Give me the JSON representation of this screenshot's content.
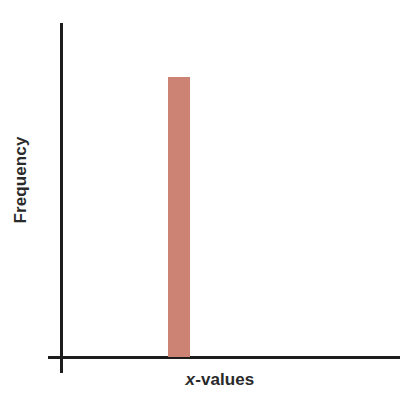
{
  "chart_data": {
    "type": "bar",
    "title": "",
    "subtitle": "",
    "xlabel": "x-values",
    "ylabel": "Frequency",
    "xlabel_italic_prefix": "x",
    "xlabel_rest": "-values",
    "categories": [
      "x"
    ],
    "values": [
      1
    ],
    "series": [
      {
        "name": "Frequency",
        "values": [
          1
        ],
        "color": "#cc8373"
      }
    ],
    "bars": [
      {
        "label": "x",
        "value": 1,
        "color": "#cc8373",
        "center_frac": 0.345,
        "width_frac": 0.065,
        "height_frac": 0.838
      }
    ],
    "ylim": [
      0,
      1.193
    ],
    "xlim": [
      0,
      1
    ],
    "grid": false,
    "legend": false,
    "legend_position": "none",
    "tick_labels_x": [],
    "tick_labels_y": [],
    "annotations": [],
    "axis_color": "#1c1c1c",
    "background": "#ffffff"
  },
  "figure": {
    "background_color": "#ffffff",
    "axis_color": "#1c1c1c",
    "bar_color": "#cc8373",
    "text_color": "#2a2a2a"
  }
}
